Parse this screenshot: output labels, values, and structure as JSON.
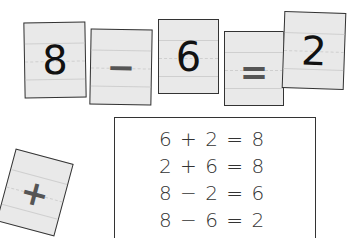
{
  "equation_cards": [
    {
      "id": "card-8",
      "value": "8",
      "type": "number"
    },
    {
      "id": "card-minus",
      "value": "−",
      "type": "operator"
    },
    {
      "id": "card-6",
      "value": "6",
      "type": "number"
    },
    {
      "id": "card-eq",
      "value": "=",
      "type": "operator"
    },
    {
      "id": "card-2",
      "value": "2",
      "type": "number"
    }
  ],
  "loose_card": {
    "id": "card-plus",
    "value": "+",
    "type": "operator"
  },
  "fact_family": [
    "6 + 2 = 8",
    "2 + 6 = 8",
    "8 − 2 = 6",
    "8 − 6 = 2"
  ]
}
